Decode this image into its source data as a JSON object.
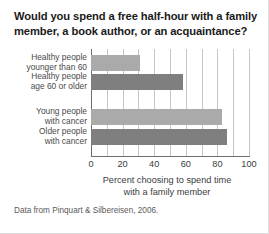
{
  "chart_data": {
    "type": "bar",
    "orientation": "horizontal",
    "title": "Would you spend a free half-hour with a family member, a book author, or an acquaintance?",
    "xlabel": "Percent choosing to spend time with a family member",
    "ylabel": "",
    "xlim": [
      0,
      100
    ],
    "xticks": [
      0,
      20,
      40,
      60,
      80,
      100
    ],
    "xtick_labels": [
      "0",
      "20",
      "40",
      "60",
      "80",
      "100"
    ],
    "grid": "vertical gridlines every 10 units",
    "legend": "none",
    "categories": [
      "Healthy people younger than 60",
      "Healthy people age 60 or older",
      "Young people with cancer",
      "Older people with cancer"
    ],
    "values": [
      31,
      58,
      83,
      86
    ],
    "bar_colors": [
      "#aaaaaa",
      "#7f7f7f",
      "#aaaaaa",
      "#7f7f7f"
    ],
    "groups": [
      {
        "name": "healthy people",
        "categories": [
          "Healthy people younger than 60",
          "Healthy people age 60 or older"
        ]
      },
      {
        "name": "people with cancer",
        "categories": [
          "Young people with cancer",
          "Older people with cancer"
        ]
      }
    ],
    "annotations": [
      "Data from Pinquart & Silbereisen, 2006."
    ]
  },
  "title": {
    "line1": "Would you spend a free half-hour with a family",
    "line2": "member, a book author, or an acquaintance?"
  },
  "category_labels": [
    {
      "line1": "Healthy people",
      "line2": "younger than 60"
    },
    {
      "line1": "Healthy people",
      "line2": "age 60 or older"
    },
    {
      "line1": "Young people",
      "line2": "with cancer"
    },
    {
      "line1": "Older people",
      "line2": "with cancer"
    }
  ],
  "axis_title": {
    "line1": "Percent choosing to spend time",
    "line2": "with a family member"
  },
  "source": "Data from Pinquart & Silbereisen, 2006.",
  "colors": {
    "bar_light": "#aaaaaa",
    "bar_dark": "#7f7f7f",
    "gridline": "#c6c6c6",
    "axis": "#6e6e6e",
    "background": "#ffffff"
  }
}
